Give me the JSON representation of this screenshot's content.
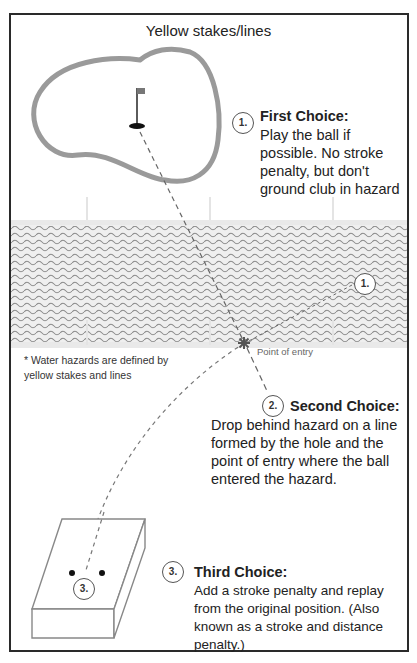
{
  "title": "Yellow stakes/lines",
  "note": "* Water hazards are defined by yellow stakes and lines",
  "point_of_entry_label": "Point of entry",
  "choices": [
    {
      "number": "1.",
      "heading": "First Choice:",
      "lines": [
        "Play the ball if",
        "possible. No stroke",
        "penalty, but don't",
        "ground club in hazard"
      ]
    },
    {
      "number": "2.",
      "heading": "Second Choice:",
      "lines": [
        "Drop behind hazard on a line",
        "formed by the hole and the",
        "point of entry where the ball",
        "entered the hazard."
      ]
    },
    {
      "number": "3.",
      "heading": "Third Choice:",
      "lines": [
        "Add a stroke penalty and replay",
        "from the original position. (Also",
        "known as a stroke and distance",
        "penalty.)"
      ]
    }
  ],
  "markers": {
    "hazard_marker": "1.",
    "tee_marker": "3."
  },
  "colors": {
    "green_outline": "#9a9a9a",
    "water_wave": "#8a8a8a",
    "border": "#2a2a2a",
    "text": "#222222"
  }
}
